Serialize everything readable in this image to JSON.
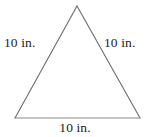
{
  "figure": {
    "name": "equilateral-triangle-diagram",
    "shape": "triangle",
    "background_color": "#ffffff",
    "stroke_color": "#6b6b6b",
    "baseline_stroke_color": "#8a8a8a",
    "text_color": "#1c1c1c",
    "vertices": {
      "apex": {
        "x": 77,
        "y": 6
      },
      "bottom_left": {
        "x": 15,
        "y": 118
      },
      "bottom_right": {
        "x": 140,
        "y": 118
      }
    },
    "labels": {
      "left_side": "10 in.",
      "right_side": "10 in.",
      "bottom_side": "10 in."
    },
    "unit": "in.",
    "side_length_value": "10"
  }
}
